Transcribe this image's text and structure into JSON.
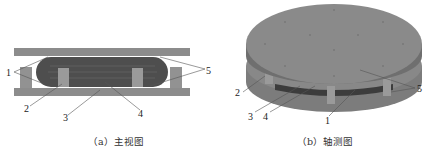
{
  "figure": {
    "panels": [
      {
        "id": "a",
        "caption": "（a）主视图",
        "labels": [
          "1",
          "2",
          "3",
          "4",
          "5"
        ]
      },
      {
        "id": "b",
        "caption": "（b）轴测图",
        "labels": [
          "2",
          "3",
          "4",
          "1",
          "5"
        ]
      }
    ],
    "colors": {
      "plate": "#8c8c8c",
      "block": "#9a9a9a",
      "core": "#505050",
      "disk_top": "#8a8a8a",
      "disk_side": "#7a7a7a",
      "leader": "#555555"
    }
  }
}
